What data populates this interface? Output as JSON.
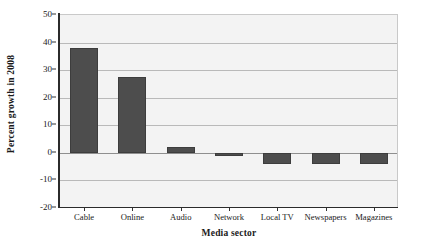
{
  "chart_data": {
    "type": "bar",
    "title": "",
    "subtitle": "",
    "xlabel": "Media sector",
    "ylabel": "Percent growth in 2008",
    "categories": [
      "Cable",
      "Online",
      "Audio",
      "Network",
      "Local TV",
      "Newspapers",
      "Magazines"
    ],
    "values": [
      38,
      27.5,
      2,
      -1,
      -4,
      -4,
      -4
    ],
    "series": [
      {
        "name": "Percent growth in 2008",
        "values": [
          38,
          27.5,
          2,
          -1,
          -4,
          -4,
          -4
        ]
      }
    ],
    "ylim": [
      -20,
      50
    ],
    "yticks": [
      50,
      40,
      30,
      20,
      10,
      0,
      -10,
      -20
    ],
    "ytick_labels": [
      "50",
      "40",
      "30",
      "20",
      "10",
      "0",
      "-10",
      "-20"
    ],
    "ytick_interval": 10,
    "grid": true,
    "grid_axis": "y",
    "legend": false,
    "legend_position": "none",
    "bar_color": "#4d4d4d",
    "plot_background": "#f3f3f3",
    "gridline_color": "#b9b9b9",
    "axis_color": "#2b2b2b",
    "annotations": []
  }
}
